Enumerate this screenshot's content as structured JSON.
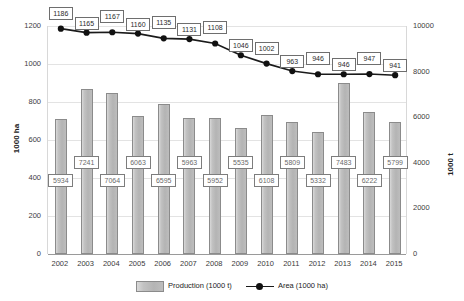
{
  "chart_data": {
    "type": "bar",
    "title": "",
    "categories": [
      "2002",
      "2003",
      "2004",
      "2005",
      "2006",
      "2007",
      "2008",
      "2009",
      "2010",
      "2011",
      "2012",
      "2013",
      "2014",
      "2015"
    ],
    "series": [
      {
        "name": "Production (1000 t)",
        "type": "bar",
        "axis": "right",
        "values": [
          5934,
          7241,
          7064,
          6063,
          6595,
          5963,
          5952,
          5535,
          6108,
          5809,
          5332,
          7483,
          6222,
          5799
        ]
      },
      {
        "name": "Area (1000 ha)",
        "type": "line",
        "axis": "left",
        "values": [
          1186,
          1165,
          1167,
          1160,
          1135,
          1131,
          1108,
          1046,
          1002,
          963,
          946,
          946,
          947,
          941
        ]
      }
    ],
    "xlabel": "",
    "ylabel": "1000 ha",
    "y2label": "1000 t",
    "ylim": [
      0,
      1200
    ],
    "y2lim": [
      0,
      10000
    ],
    "yticks": [
      0,
      200,
      400,
      600,
      800,
      1000,
      1200
    ],
    "y2ticks": [
      0,
      2000,
      4000,
      6000,
      8000,
      10000
    ],
    "grid": true,
    "legend_position": "bottom",
    "data_labels": true
  },
  "axes": {
    "left_title": "1000 ha",
    "right_title": "1000 t",
    "left_ticks": [
      "1200",
      "1000",
      "800",
      "600",
      "400",
      "200",
      "0"
    ],
    "right_ticks": [
      "10000",
      "8000",
      "6000",
      "4000",
      "2000",
      "0"
    ]
  },
  "legend": {
    "items": [
      {
        "label": "Production (1000 t)",
        "marker": "bar-swatch-icon"
      },
      {
        "label": "Area (1000 ha)",
        "marker": "line-marker-icon"
      }
    ]
  },
  "colors": {
    "bar_fill": "#bdbdbd",
    "bar_border": "#8b8b8b",
    "line": "#1a1a1a",
    "marker": "#111111",
    "grid": "#e3e3e3",
    "axis_text": "#3a3a3a",
    "label_box_border": "#6e6e6e",
    "label_box_bg": "#ffffff"
  }
}
